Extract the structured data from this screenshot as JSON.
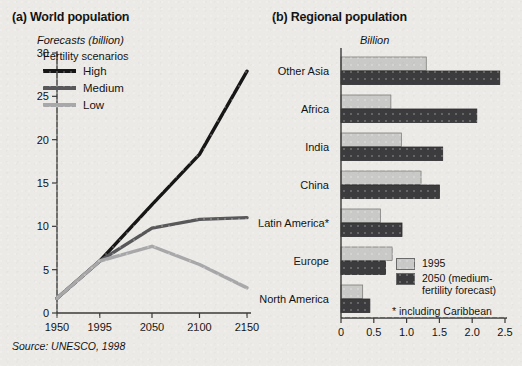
{
  "figure": {
    "source_note": "Source: UNESCO, 1998",
    "background_color": "#eceae6"
  },
  "panel_a": {
    "title": "(a) World population",
    "unit_label": "Forecasts (billion)",
    "legend_title": "Fertility scenarios",
    "legend": [
      {
        "label": "High",
        "color": "#171717"
      },
      {
        "label": "Medium",
        "color": "#58585a"
      },
      {
        "label": "Low",
        "color": "#a8a8aa"
      }
    ]
  },
  "panel_b": {
    "title": "(b) Regional population",
    "unit_label": "Billion",
    "legend": [
      {
        "label": "1995",
        "color": "#c9c9c7"
      },
      {
        "label": "2050 (medium-fertility forecast)",
        "color": "#3c3c3e"
      }
    ],
    "footnote": "* including Caribbean"
  },
  "chart_data": [
    {
      "id": "world-population",
      "type": "line",
      "title": "(a) World population",
      "xlabel": "",
      "ylabel": "Forecasts (billion)",
      "x": [
        1950,
        1995,
        2050,
        2100,
        2150
      ],
      "xticks": [
        "1950",
        "1995",
        "2050",
        "2100",
        "2150"
      ],
      "yticks": [
        0,
        5,
        10,
        15,
        20,
        25,
        30
      ],
      "ylim": [
        0,
        30
      ],
      "xlim": [
        1950,
        2150
      ],
      "grid": false,
      "legend_position": "upper-left-inside",
      "series": [
        {
          "name": "High",
          "color": "#171717",
          "values": [
            1.7,
            6.0,
            12.5,
            18.3,
            27.9
          ]
        },
        {
          "name": "Medium",
          "color": "#58585a",
          "values": [
            1.7,
            6.0,
            9.8,
            10.8,
            11.0
          ]
        },
        {
          "name": "Low",
          "color": "#a8a8aa",
          "values": [
            1.7,
            6.0,
            7.7,
            5.6,
            2.9
          ]
        }
      ]
    },
    {
      "id": "regional-population",
      "type": "bar",
      "orientation": "horizontal",
      "title": "(b) Regional population",
      "xlabel": "Billion",
      "ylabel": "",
      "categories": [
        "Other Asia",
        "Africa",
        "India",
        "China",
        "Latin America*",
        "Europe",
        "North America"
      ],
      "xticks": [
        "0",
        "0.5",
        "1.0",
        "1.5",
        "2.0",
        "2.5"
      ],
      "xtick_values": [
        0,
        0.5,
        1.0,
        1.5,
        2.0,
        2.5
      ],
      "xlim": [
        0,
        2.5
      ],
      "grid": false,
      "legend_position": "lower-right-inside",
      "series": [
        {
          "name": "1995",
          "color": "#c9c9c7",
          "values": [
            1.3,
            0.76,
            0.92,
            1.22,
            0.6,
            0.78,
            0.33
          ]
        },
        {
          "name": "2050 (medium-fertility forecast)",
          "color": "#3c3c3e",
          "values": [
            2.42,
            2.07,
            1.55,
            1.5,
            0.93,
            0.68,
            0.44
          ]
        }
      ]
    }
  ]
}
